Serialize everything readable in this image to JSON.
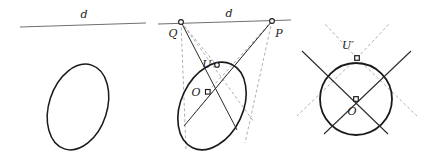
{
  "figure": {
    "background_color": "#ffffff",
    "width": 442,
    "height": 165,
    "stroke_colors": {
      "conic": "#1a1a1a",
      "solid_line": "#3a3a3a",
      "directrix": "#707070",
      "dashed_line": "#8c8c8c",
      "marker_fill": "#ffffff",
      "marker_stroke": "#1a1a1a",
      "label_text": "#1a1a1a"
    }
  },
  "panels": [
    {
      "id": "panel-left",
      "name": "ellipse-and-line",
      "labels": [
        {
          "id": "d-left",
          "text": "d",
          "x": 84,
          "y": 18,
          "kind": "line-label"
        }
      ],
      "directrix": {
        "x1": 20,
        "y1": 27,
        "x2": 146,
        "y2": 23,
        "label": "d"
      },
      "conic": {
        "type": "ellipse",
        "cx": 78,
        "cy": 107,
        "rx": 29,
        "ry": 44,
        "rotation": 18
      },
      "points": [],
      "solid_lines": [],
      "dashed_lines": []
    },
    {
      "id": "panel-middle",
      "name": "pole-polar-ellipse",
      "labels": [
        {
          "id": "d-mid",
          "text": "d",
          "x": 229,
          "y": 18,
          "kind": "line-label"
        },
        {
          "id": "Q-mid",
          "text": "Q",
          "x": 173,
          "y": 36,
          "kind": "point-label"
        },
        {
          "id": "P-mid",
          "text": "P",
          "x": 277,
          "y": 36,
          "kind": "point-label"
        },
        {
          "id": "U-mid",
          "text": "U",
          "x": 206,
          "y": 67,
          "kind": "point-label"
        },
        {
          "id": "O-mid",
          "text": "O",
          "x": 197,
          "y": 96,
          "kind": "point-label"
        }
      ],
      "directrix": {
        "x1": 158,
        "y1": 24,
        "x2": 291,
        "y2": 20,
        "label": "d"
      },
      "conic": {
        "type": "ellipse",
        "cx": 212,
        "cy": 106,
        "rx": 31,
        "ry": 46,
        "rotation": 25
      },
      "points": [
        {
          "id": "Q",
          "label": "Q",
          "x": 181,
          "y": 22,
          "marker": "circle"
        },
        {
          "id": "P",
          "label": "P",
          "x": 272,
          "y": 21,
          "marker": "circle"
        },
        {
          "id": "U",
          "label": "U",
          "x": 216,
          "y": 65,
          "marker": "circle"
        },
        {
          "id": "O",
          "label": "O",
          "x": 208,
          "y": 92,
          "marker": "square"
        }
      ],
      "solid_lines": [
        {
          "from": "Q",
          "to": "chord-end-1",
          "x1": 181,
          "y1": 22,
          "x2": 235,
          "y2": 128
        },
        {
          "from": "P",
          "to": "chord-end-2",
          "x1": 272,
          "y1": 21,
          "x2": 185,
          "y2": 125
        },
        {
          "from": "Q",
          "to": "O",
          "x1": 181,
          "y1": 22,
          "x2": 208,
          "y2": 92
        },
        {
          "from": "P",
          "to": "U",
          "x1": 272,
          "y1": 21,
          "x2": 216,
          "y2": 65
        }
      ],
      "dashed_lines": [
        {
          "from": "Q",
          "to": "tangent-lower",
          "x1": 181,
          "y1": 22,
          "x2": 186,
          "y2": 150
        },
        {
          "from": "Q",
          "to": "U",
          "x1": 181,
          "y1": 22,
          "x2": 216,
          "y2": 65
        },
        {
          "from": "Q",
          "to": "far-right",
          "x1": 181,
          "y1": 22,
          "x2": 252,
          "y2": 120
        },
        {
          "from": "P",
          "to": "tangent-lower",
          "x1": 272,
          "y1": 21,
          "x2": 243,
          "y2": 140
        },
        {
          "from": "P",
          "to": "O",
          "x1": 272,
          "y1": 21,
          "x2": 208,
          "y2": 92
        },
        {
          "from": "P",
          "to": "left-side",
          "x1": 272,
          "y1": 21,
          "x2": 196,
          "y2": 112
        }
      ]
    },
    {
      "id": "panel-right",
      "name": "circle-pole-polar",
      "labels": [
        {
          "id": "Uprime-right",
          "text": "U′",
          "x": 349,
          "y": 46,
          "kind": "point-label"
        },
        {
          "id": "O-right",
          "text": "O",
          "x": 352,
          "y": 112,
          "kind": "point-label"
        }
      ],
      "directrix": null,
      "conic": {
        "type": "circle",
        "cx": 356,
        "cy": 99,
        "rx": 36,
        "ry": 36,
        "rotation": 0
      },
      "points": [
        {
          "id": "Uprime",
          "label": "U′",
          "x": 355,
          "y": 56,
          "marker": "square"
        },
        {
          "id": "Oc",
          "label": "O",
          "x": 356,
          "y": 99,
          "marker": "square"
        }
      ],
      "solid_lines": [
        {
          "from": "upper-left-ray",
          "to": "O-through",
          "x1": 303,
          "y1": 52,
          "x2": 386,
          "y2": 132
        },
        {
          "from": "upper-right-ray",
          "to": "O-through",
          "x1": 409,
          "y1": 52,
          "x2": 326,
          "y2": 132
        }
      ],
      "dashed_lines": [
        {
          "from": "Uprime",
          "to": "upper-left",
          "x1": 355,
          "y1": 56,
          "x2": 325,
          "y2": 24
        },
        {
          "from": "Uprime",
          "to": "upper-right",
          "x1": 355,
          "y1": 56,
          "x2": 387,
          "y2": 24
        },
        {
          "from": "Uprime",
          "to": "lower-left",
          "x1": 355,
          "y1": 56,
          "x2": 300,
          "y2": 112
        },
        {
          "from": "Uprime",
          "to": "lower-right",
          "x1": 355,
          "y1": 56,
          "x2": 412,
          "y2": 112
        }
      ]
    }
  ]
}
